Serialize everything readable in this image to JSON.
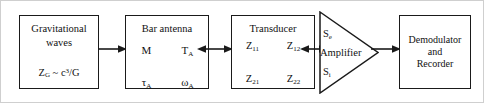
{
  "diagram": {
    "background_color": "#ffffff",
    "line_color": "#1a1a1a",
    "border_color": "#cfcfcf"
  },
  "blocks": {
    "gravitational_waves": {
      "name": "gravitational-waves",
      "title_line_1": "Gravitational",
      "title_line_2": "waves",
      "formula_text": "Z_G ~ c3/G",
      "formula_z": "Z",
      "formula_z_sub": "G",
      "formula_rel": " ~ ",
      "formula_c": "c",
      "formula_c_sup": "3",
      "formula_denom": "/G"
    },
    "bar_antenna": {
      "name": "bar-antenna",
      "title": "Bar antenna",
      "symbols": [
        {
          "base": "M",
          "sub": ""
        },
        {
          "base": "T",
          "sub": "A"
        },
        {
          "base": "τ",
          "sub": "A"
        },
        {
          "base": "ω",
          "sub": "A"
        }
      ]
    },
    "transducer": {
      "name": "transducer",
      "title": "Transducer",
      "symbols": [
        {
          "base": "Z",
          "sub": "11"
        },
        {
          "base": "Z",
          "sub": "12"
        },
        {
          "base": "Z",
          "sub": "21"
        },
        {
          "base": "Z",
          "sub": "22"
        }
      ]
    },
    "amplifier": {
      "name": "amplifier",
      "label": "Amplifier",
      "noise_out_base": "S",
      "noise_out_sub": "e",
      "noise_in_base": "S",
      "noise_in_sub": "i"
    },
    "demodulator": {
      "name": "demodulator-and-recorder",
      "line_1": "Demodulator",
      "line_2": "and",
      "line_3": "Recorder"
    }
  },
  "arrows": [
    {
      "name": "arrow-waves-to-antenna",
      "type": "single-right",
      "from": "gravitational_waves",
      "to": "bar_antenna"
    },
    {
      "name": "arrow-antenna-to-transducer",
      "type": "double-headed",
      "from": "bar_antenna",
      "to": "transducer"
    },
    {
      "name": "arrow-transducer-to-amplifier",
      "type": "double-headed",
      "from": "transducer",
      "to": "amplifier"
    },
    {
      "name": "arrow-amplifier-to-demodulator",
      "type": "single-right",
      "from": "amplifier",
      "to": "demodulator"
    }
  ]
}
